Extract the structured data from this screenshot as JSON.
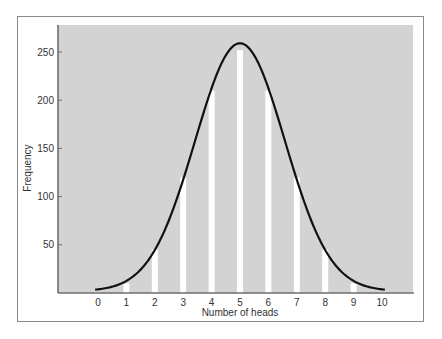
{
  "chart_data": {
    "type": "bar",
    "title": "",
    "xlabel": "Number of heads",
    "ylabel": "Frequency",
    "categories": [
      "0",
      "1",
      "2",
      "3",
      "4",
      "5",
      "6",
      "7",
      "8",
      "9",
      "10"
    ],
    "values": [
      1,
      10,
      45,
      120,
      210,
      252,
      210,
      120,
      45,
      10,
      1
    ],
    "overlay": {
      "type": "line",
      "name": "normal curve",
      "description": "Smooth normal (Gaussian) curve fitted over bars, mean 5, peak ~257"
    },
    "yticks": [
      50,
      100,
      150,
      200,
      250
    ],
    "ylim": [
      0,
      280
    ],
    "xlim": [
      -1.5,
      11.2
    ],
    "grid": false,
    "legend": null
  },
  "colors": {
    "plot_background": "#d3d3d3",
    "bars": "#ffffff",
    "curve": "#111111",
    "axis": "#6e6e6e",
    "frame": "#8a8a8a"
  }
}
